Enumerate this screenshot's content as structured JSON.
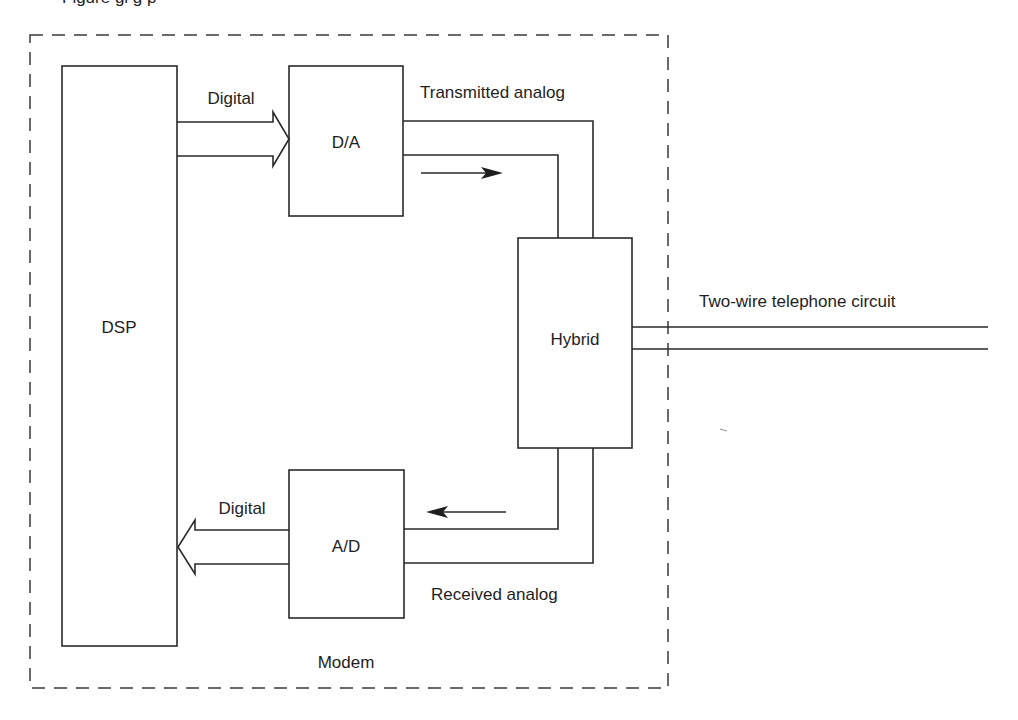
{
  "figure": {
    "caption_fragment": "Figure gi g p",
    "enclosure_label": "Modem"
  },
  "blocks": {
    "dsp": "DSP",
    "da": "D/A",
    "ad": "A/D",
    "hybrid": "Hybrid"
  },
  "signals": {
    "digital_out": "Digital",
    "digital_in": "Digital",
    "transmitted": "Transmitted analog",
    "received": "Received analog",
    "line": "Two-wire telephone circuit"
  },
  "colors": {
    "stroke": "#2a2a2a",
    "text": "#1e1e1e",
    "background": "#ffffff"
  }
}
